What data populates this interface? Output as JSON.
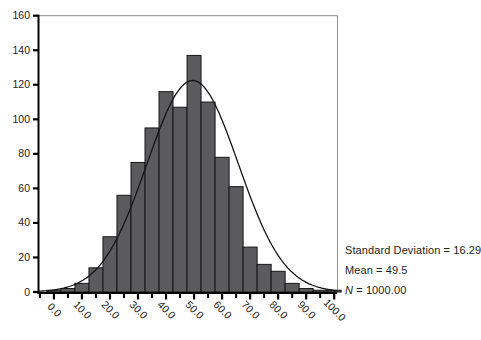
{
  "chart_data": {
    "type": "bar",
    "subtype": "histogram-with-normal-curve",
    "title": "",
    "xlabel": "",
    "ylabel": "",
    "bin_width": 5,
    "bin_centers": [
      0,
      5,
      10,
      15,
      20,
      25,
      30,
      35,
      40,
      45,
      50,
      55,
      60,
      65,
      70,
      75,
      80,
      85,
      90,
      95,
      100
    ],
    "values": [
      1,
      2,
      5,
      14,
      32,
      56,
      75,
      95,
      116,
      107,
      137,
      110,
      78,
      61,
      26,
      16,
      12,
      5,
      2,
      1,
      1
    ],
    "x_tick_labels": [
      "0.0",
      "10.0",
      "20.0",
      "30.0",
      "40.0",
      "50.0",
      "60.0",
      "70.0",
      "80.0",
      "90.0",
      "100.0"
    ],
    "x_major_ticks": [
      0,
      10,
      20,
      30,
      40,
      50,
      60,
      70,
      80,
      90,
      100
    ],
    "x_minor_ticks": [
      -5,
      5,
      15,
      25,
      35,
      45,
      55,
      65,
      75,
      85,
      95
    ],
    "y_ticks": [
      0,
      20,
      40,
      60,
      80,
      100,
      120,
      140,
      160
    ],
    "y_tick_labels": [
      "0",
      "20",
      "40",
      "60",
      "80",
      "100",
      "120",
      "140",
      "160"
    ],
    "ylim": [
      0,
      160
    ],
    "xlim": [
      -5.5,
      101
    ],
    "grid": false,
    "legend": "none",
    "normal_curve": {
      "mean": 49.5,
      "sd": 16.29,
      "n": 1000,
      "peak_height": 122.45
    },
    "annotations": [
      "Standard Deviation = 16.29",
      "Mean = 49.5",
      "N = 1000.00"
    ]
  },
  "stats": {
    "lines": [
      {
        "label": "Standard Deviation",
        "sep": " = ",
        "value": "16.29",
        "italic": false
      },
      {
        "label": "Mean",
        "sep": " = ",
        "value": "49.5",
        "italic": false
      },
      {
        "label": "N",
        "sep": " = ",
        "value": "1000.00",
        "italic": true
      }
    ]
  },
  "colors": {
    "bar_fill": "#5b5b5d",
    "bar_stroke": "#161616",
    "curve": "#161616",
    "axis": "#000000",
    "frame": "#8f8f8f",
    "text": "#1c1c1c",
    "background": "#ffffff"
  }
}
